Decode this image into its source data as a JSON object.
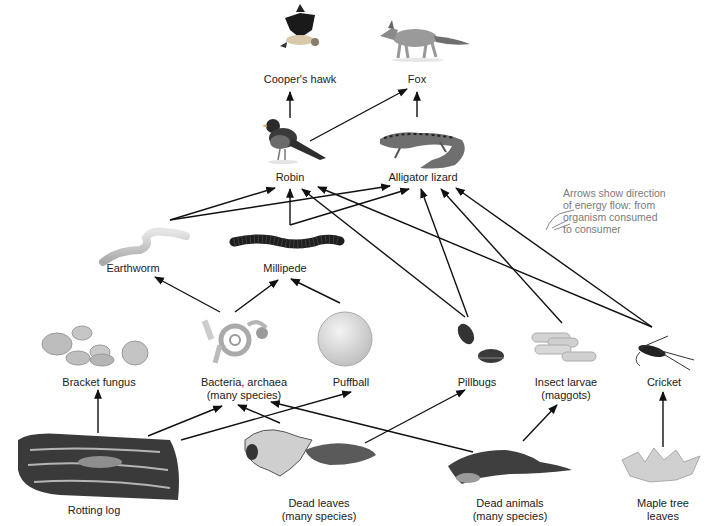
{
  "diagram": {
    "type": "food-web",
    "note": {
      "icon": "pointing-hand-icon",
      "lines": [
        "Arrows show direction",
        "of energy flow: from",
        "organism consumed",
        "to consumer"
      ]
    },
    "nodes": {
      "hawk": {
        "lines": [
          "Cooper's hawk"
        ],
        "icon": "hawk-icon"
      },
      "fox": {
        "lines": [
          "Fox"
        ],
        "icon": "fox-icon"
      },
      "robin": {
        "lines": [
          "Robin"
        ],
        "icon": "robin-icon"
      },
      "lizard": {
        "lines": [
          "Alligator lizard"
        ],
        "icon": "lizard-icon"
      },
      "earthworm": {
        "lines": [
          "Earthworm"
        ],
        "icon": "earthworm-icon"
      },
      "millipede": {
        "lines": [
          "Millipede"
        ],
        "icon": "millipede-icon"
      },
      "bracket": {
        "lines": [
          "Bracket fungus"
        ],
        "icon": "bracket-fungus-icon"
      },
      "bacteria": {
        "lines": [
          "Bacteria, archaea",
          "(many species)"
        ],
        "icon": "bacteria-icon"
      },
      "puffball": {
        "lines": [
          "Puffball"
        ],
        "icon": "puffball-icon"
      },
      "pillbugs": {
        "lines": [
          "Pillbugs"
        ],
        "icon": "pillbug-icon"
      },
      "larvae": {
        "lines": [
          "Insect larvae",
          "(maggots)"
        ],
        "icon": "larvae-icon"
      },
      "cricket": {
        "lines": [
          "Cricket"
        ],
        "icon": "cricket-icon"
      },
      "log": {
        "lines": [
          "Rotting log"
        ],
        "icon": "log-icon"
      },
      "leaves": {
        "lines": [
          "Dead leaves",
          "(many species)"
        ],
        "icon": "dead-leaves-icon"
      },
      "animals": {
        "lines": [
          "Dead animals",
          "(many species)"
        ],
        "icon": "dead-animal-icon"
      },
      "maple": {
        "lines": [
          "Maple tree",
          "leaves"
        ],
        "icon": "maple-leaf-icon"
      }
    },
    "edges": [
      {
        "from": "robin",
        "to": "hawk"
      },
      {
        "from": "robin",
        "to": "fox"
      },
      {
        "from": "lizard",
        "to": "fox"
      },
      {
        "from": "earthworm",
        "to": "robin"
      },
      {
        "from": "earthworm",
        "to": "lizard"
      },
      {
        "from": "millipede",
        "to": "robin"
      },
      {
        "from": "millipede",
        "to": "lizard"
      },
      {
        "from": "pillbugs",
        "to": "robin"
      },
      {
        "from": "pillbugs",
        "to": "lizard"
      },
      {
        "from": "larvae",
        "to": "lizard"
      },
      {
        "from": "cricket",
        "to": "robin"
      },
      {
        "from": "cricket",
        "to": "lizard"
      },
      {
        "from": "bacteria",
        "to": "earthworm"
      },
      {
        "from": "bacteria",
        "to": "millipede"
      },
      {
        "from": "puffball",
        "to": "millipede"
      },
      {
        "from": "log",
        "to": "bracket"
      },
      {
        "from": "log",
        "to": "bacteria"
      },
      {
        "from": "log",
        "to": "puffball"
      },
      {
        "from": "leaves",
        "to": "bacteria"
      },
      {
        "from": "leaves",
        "to": "pillbugs"
      },
      {
        "from": "animals",
        "to": "bacteria"
      },
      {
        "from": "animals",
        "to": "larvae"
      },
      {
        "from": "maple",
        "to": "cricket"
      }
    ],
    "colors": {
      "line": "#111111",
      "label": "#222222",
      "note": "#7a7a7a"
    }
  }
}
